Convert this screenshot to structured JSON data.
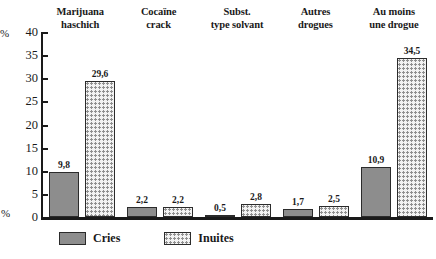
{
  "chart_data": {
    "type": "bar",
    "title": "",
    "subtitle": "",
    "xlabel": "",
    "ylabel": "%",
    "ylim": [
      0,
      40
    ],
    "yticks": [
      0,
      5,
      10,
      15,
      20,
      25,
      30,
      35,
      40
    ],
    "ytick_labels": [
      "0",
      "5",
      "10",
      "15",
      "20",
      "25",
      "30",
      "35",
      "40"
    ],
    "axis_unit_top": "%",
    "axis_unit_bottom": "%",
    "grid": false,
    "legend_position": "bottom-left",
    "categories": [
      "Marijuana haschich",
      "Cocaïne crack",
      "Subst. type solvant",
      "Autres drogues",
      "Au moins une drogue"
    ],
    "category_lines": [
      [
        "Marijuana",
        "haschich"
      ],
      [
        "Cocaïne",
        "crack"
      ],
      [
        "Subst.",
        "type solvant"
      ],
      [
        "Autres",
        "drogues"
      ],
      [
        "Au moins",
        "une drogue"
      ]
    ],
    "series": [
      {
        "name": "Cries",
        "values": [
          9.8,
          2.2,
          0.5,
          1.7,
          10.9
        ],
        "value_labels": [
          "9,8",
          "2,2",
          "0,5",
          "1,7",
          "10,9"
        ],
        "fill": "solid-gray",
        "color": "#8d8d8d"
      },
      {
        "name": "Inuites",
        "values": [
          29.6,
          2.2,
          2.8,
          2.5,
          34.5
        ],
        "value_labels": [
          "29,6",
          "2,2",
          "2,8",
          "2,5",
          "34,5"
        ],
        "fill": "dotted-pattern",
        "color": "#f2f2f2"
      }
    ]
  },
  "legend": {
    "items": [
      {
        "label": "Cries",
        "swatch": "solid-gray"
      },
      {
        "label": "Inuites",
        "swatch": "dotted-pattern"
      }
    ]
  }
}
